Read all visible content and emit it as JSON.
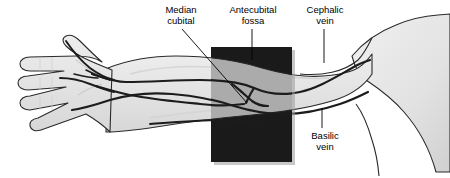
{
  "figure": {
    "type": "anatomical-illustration",
    "view": "anterior view of extended arm, palm up, hand at left, shoulder at right"
  },
  "colors": {
    "background": "#ffffff",
    "skin_fill": "#e3e3e3",
    "skin_fill_light": "#ececec",
    "skin_outline": "#222222",
    "vein_stroke": "#1c1c1c",
    "vein_fill": "#d8d8d8",
    "highlight_rect": "#1a1a1a",
    "highlight_rect_shadow": "#9a9a9a",
    "label_text": "#000000",
    "leader_line": "#000000"
  },
  "labels": [
    {
      "id": "median-cubital",
      "text": "Median\ncubital",
      "line1": "Median",
      "line2": "cubital",
      "points_to": "median cubital vein crossing the antecubital fossa"
    },
    {
      "id": "antecubital-fossa",
      "text": "Antecubital\nfossa",
      "line1": "Antecubital",
      "line2": "fossa",
      "points_to": "dark shaded rectangle over the elbow crease"
    },
    {
      "id": "cephalic-vein",
      "text": "Cephalic\nvein",
      "line1": "Cephalic",
      "line2": "vein",
      "points_to": "upper (lateral) vein running toward the shoulder"
    },
    {
      "id": "basilic-vein",
      "text": "Basilic\nvein",
      "line1": "Basilic",
      "line2": "vein",
      "points_to": "lower (medial) vein running toward the axilla"
    }
  ],
  "highlight_region": {
    "name": "antecubital-fossa-highlight",
    "shape": "rectangle",
    "x": 211,
    "y": 47,
    "width": 81,
    "height": 115
  },
  "veins": [
    {
      "id": "cephalic-vein",
      "label": "Cephalic vein",
      "position": "lateral / upper"
    },
    {
      "id": "basilic-vein",
      "label": "Basilic vein",
      "position": "medial / lower"
    },
    {
      "id": "median-cubital-vein",
      "label": "Median cubital vein",
      "position": "oblique connector across the fossa"
    },
    {
      "id": "median-antebrachial-vein",
      "label": "Median antebrachial vein",
      "position": "central forearm"
    },
    {
      "id": "dorsal-hand-veins",
      "label": "Dorsal venous network of hand",
      "position": "hand"
    }
  ]
}
